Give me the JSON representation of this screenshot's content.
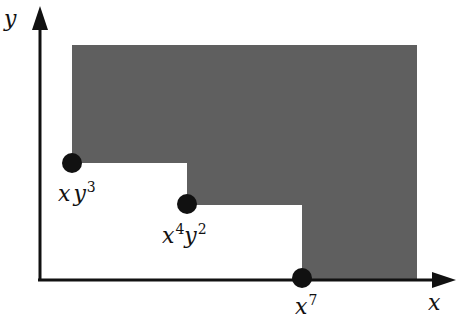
{
  "diagram": {
    "axes": {
      "x_label": "x",
      "y_label": "y"
    },
    "region": {
      "fill": "#5f5f5f",
      "description": "staircase shaded region"
    },
    "points": [
      {
        "base1": "x",
        "base2": "y",
        "exp2": "3",
        "label": "xy^3"
      },
      {
        "base1": "x",
        "exp1": "4",
        "base2": "y",
        "exp2": "2",
        "label": "x^4y^2"
      },
      {
        "base1": "x",
        "exp1": "7",
        "label": "x^7"
      }
    ],
    "colors": {
      "axis": "#111111",
      "dot": "#111111",
      "shade": "#5f5f5f"
    }
  }
}
